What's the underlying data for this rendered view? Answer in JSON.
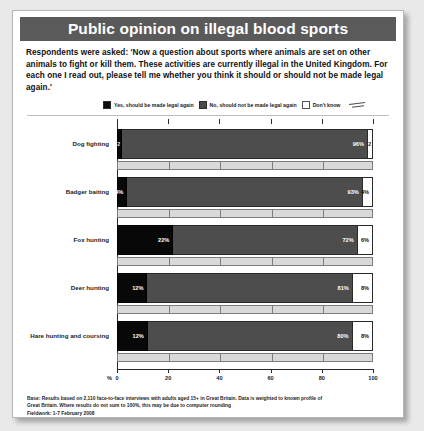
{
  "header": {
    "title": "Public opinion on illegal blood sports"
  },
  "intro": {
    "text": "Respondents were asked: 'Now a question about sports where animals are set on other animals to fight or kill them. These activities are currently illegal in the United Kingdom. For each one I read out, please tell me whether you think it should or should not be made legal again.'"
  },
  "legend": {
    "items": [
      {
        "key": "yes",
        "label": "Yes, should be made legal again",
        "color": "#080808"
      },
      {
        "key": "no",
        "label": "No, should not be made legal again",
        "color": "#4d4d4d"
      },
      {
        "key": "dk",
        "label": "Don't know",
        "color": "#ffffff"
      }
    ]
  },
  "axis": {
    "pct_symbol": "%",
    "ticks": [
      "0",
      "20",
      "40",
      "60",
      "80",
      "100"
    ]
  },
  "footer": {
    "base_note": "Base: Results based on 2,110 face-to-face interviews with adults aged 15+ in Great Britain. Data is weighted to known profile of Great Britain. Where results do not sum to 100%, this may be due to computer rounding",
    "fieldwork": "Fieldwork: 1-7 February 2008",
    "source": "Source: Ipsos MORI, 29 February 2008"
  },
  "chart_data": {
    "type": "bar",
    "orientation": "horizontal",
    "stacked": true,
    "title": "Public opinion on illegal blood sports",
    "xlabel": "%",
    "ylabel": "",
    "xlim": [
      0,
      100
    ],
    "grid": false,
    "legend_position": "top",
    "categories": [
      "Dog fighting",
      "Badger baiting",
      "Fox hunting",
      "Deer hunting",
      "Hare hunting and coursing"
    ],
    "series": [
      {
        "name": "Yes, should be made legal again",
        "values": [
          2,
          4,
          22,
          12,
          12
        ],
        "labels": [
          "2",
          "4%",
          "22%",
          "12%",
          "12%"
        ]
      },
      {
        "name": "No, should not be made legal again",
        "values": [
          96,
          93,
          72,
          81,
          80
        ],
        "labels": [
          "96%",
          "93%",
          "72%",
          "81%",
          "80%"
        ]
      },
      {
        "name": "Don't know",
        "values": [
          2,
          4,
          6,
          8,
          8
        ],
        "labels": [
          "2",
          "4%",
          "6%",
          "8%",
          "8%"
        ]
      }
    ]
  }
}
